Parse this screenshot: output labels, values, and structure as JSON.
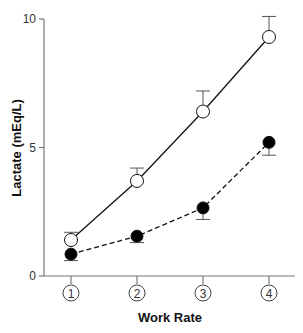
{
  "chart_data": {
    "type": "line",
    "title": "",
    "xlabel": "Work Rate",
    "ylabel": "Lactate (mEq/L)",
    "categories": [
      "1",
      "2",
      "3",
      "4"
    ],
    "ylim": [
      0,
      10
    ],
    "yticks": [
      0,
      5,
      10
    ],
    "grid": false,
    "legend": null,
    "series": [
      {
        "name": "open-circles",
        "marker": "open-circle",
        "line_style": "solid",
        "values": [
          1.4,
          3.7,
          6.4,
          9.3
        ],
        "error_upper": [
          1.7,
          4.2,
          7.2,
          10.1
        ]
      },
      {
        "name": "filled-circles",
        "marker": "filled-circle",
        "line_style": "dashed",
        "values": [
          0.85,
          1.55,
          2.65,
          5.2
        ],
        "error_lower": [
          0.6,
          1.3,
          2.2,
          4.7
        ]
      }
    ]
  },
  "axes": {
    "y_tick_labels": [
      "0",
      "5",
      "10"
    ],
    "x_tick_labels": [
      "1",
      "2",
      "3",
      "4"
    ],
    "x_title": "Work Rate",
    "y_title": "Lactate (mEq/L)"
  },
  "colors": {
    "axis": "#777777",
    "line": "#111111",
    "marker_fill_open": "#ffffff",
    "marker_fill_closed": "#000000"
  }
}
